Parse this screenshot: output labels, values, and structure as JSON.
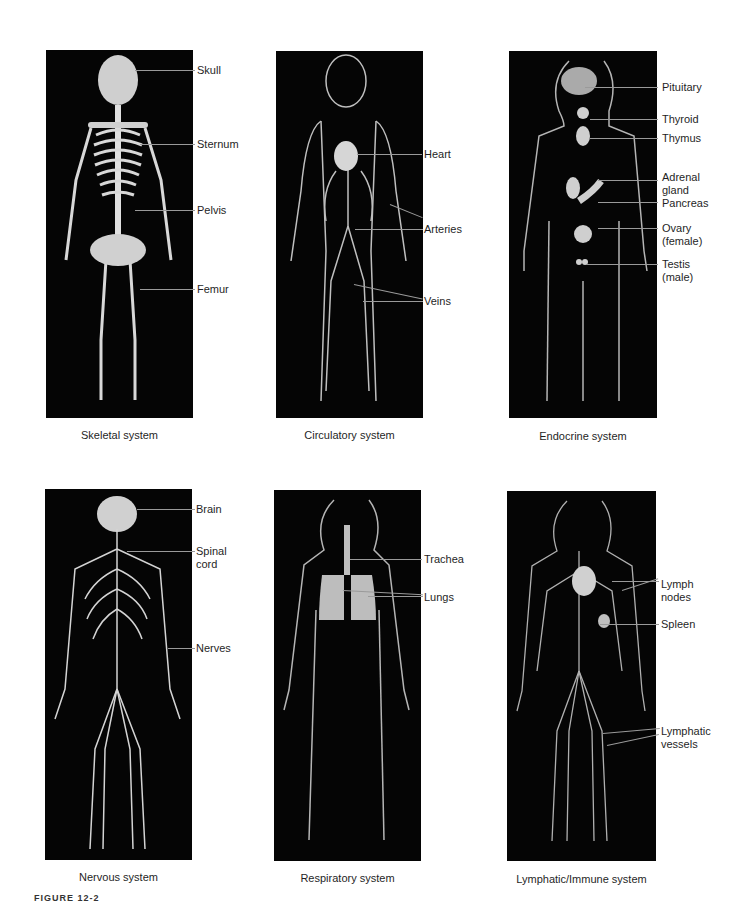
{
  "figure": {
    "number_partial": "FIGURE 12-2"
  },
  "panels": [
    {
      "id": "skeletal",
      "caption": "Skeletal system",
      "labels": [
        "Skull",
        "Sternum",
        "Pelvis",
        "Femur"
      ]
    },
    {
      "id": "circulatory",
      "caption": "Circulatory system",
      "labels": [
        "Heart",
        "Arteries",
        "Veins"
      ]
    },
    {
      "id": "endocrine",
      "caption": "Endocrine system",
      "labels": [
        "Pituitary",
        "Thyroid",
        "Thymus",
        "Adrenal\ngland",
        "Pancreas",
        "Ovary\n(female)",
        "Testis\n(male)"
      ]
    },
    {
      "id": "nervous",
      "caption": "Nervous system",
      "labels": [
        "Brain",
        "Spinal\ncord",
        "Nerves"
      ]
    },
    {
      "id": "respiratory",
      "caption": "Respiratory system",
      "labels": [
        "Trachea",
        "Lungs"
      ]
    },
    {
      "id": "lymphatic",
      "caption": "Lymphatic/Immune system",
      "labels": [
        "Lymph\nnodes",
        "Spleen",
        "Lymphatic\nvessels"
      ]
    }
  ],
  "colors": {
    "photo_background": "#050505",
    "figure_highlight": "#d8d8d8",
    "leader_line": "#9a9a9a",
    "text": "#1f1f1f"
  }
}
